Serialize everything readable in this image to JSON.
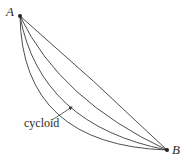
{
  "diagram": {
    "type": "brachistochrone-curves",
    "points": {
      "A": {
        "label": "A",
        "x": 20,
        "y": 16
      },
      "B": {
        "label": "B",
        "x": 167,
        "y": 150
      }
    },
    "curves": [
      {
        "name": "straight-line",
        "d": "M20,16 Q94,80 167,150"
      },
      {
        "name": "curve-2",
        "d": "M20,16 Q60,100 167,150"
      },
      {
        "name": "cycloid",
        "d": "M20,16 Q40,125 167,150"
      },
      {
        "name": "curve-4",
        "d": "M20,16 Q22,145 167,150"
      }
    ],
    "annotation": {
      "label": "cycloid",
      "arrow_from": {
        "x": 52,
        "y": 120
      },
      "arrow_to": {
        "x": 72,
        "y": 107
      }
    },
    "colors": {
      "stroke": "#3a3a3a",
      "text": "#2a2a2a",
      "background": "#ffffff"
    }
  }
}
